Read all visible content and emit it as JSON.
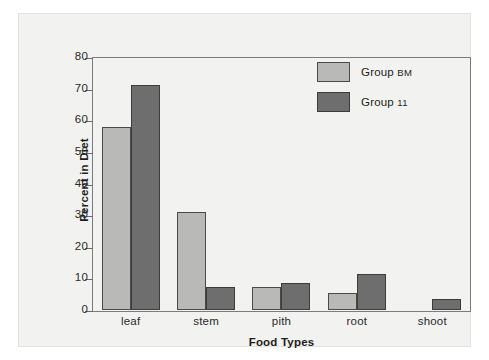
{
  "chart_data": {
    "type": "bar",
    "title": "",
    "xlabel": "Food Types",
    "ylabel": "Percent in Diet",
    "categories": [
      "leaf",
      "stem",
      "pith",
      "root",
      "shoot"
    ],
    "ylim": [
      0,
      80
    ],
    "yticks": [
      0,
      10,
      20,
      30,
      40,
      50,
      60,
      70,
      80
    ],
    "ytick_labels": [
      "0",
      "10",
      "20",
      "30",
      "40",
      "50",
      "60",
      "70",
      "80"
    ],
    "grid": false,
    "legend_position": "top-right",
    "series": [
      {
        "name": "Group BM",
        "name_prefix": "Group ",
        "name_suffix": "BM",
        "color": "#b9b9b7",
        "values": [
          58,
          31,
          7.3,
          5.5,
          0
        ]
      },
      {
        "name": "Group 11",
        "name_prefix": "Group ",
        "name_suffix": "11",
        "color": "#6e6e6e",
        "values": [
          71,
          7.3,
          8.5,
          11.3,
          3.5
        ]
      }
    ]
  },
  "legend": {
    "entries": [
      {
        "prefix": "Group ",
        "suffix": "BM"
      },
      {
        "prefix": "Group ",
        "suffix": "11"
      }
    ]
  }
}
